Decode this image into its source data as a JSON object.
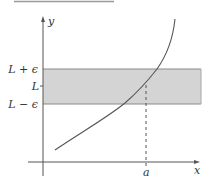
{
  "diagram": {
    "type": "epsilon-limit-illustration",
    "axes": {
      "x_label": "x",
      "y_label": "y"
    },
    "band": {
      "upper_label": "L + ϵ",
      "center_label": "L",
      "lower_label": "L − ϵ",
      "fill_color": "#d4d4d4",
      "border_color": "#8a8a8a"
    },
    "point": {
      "x_label": "a"
    },
    "colors": {
      "curve": "#555555",
      "axis": "#555555",
      "top_rule": "#9a9a9a"
    }
  }
}
